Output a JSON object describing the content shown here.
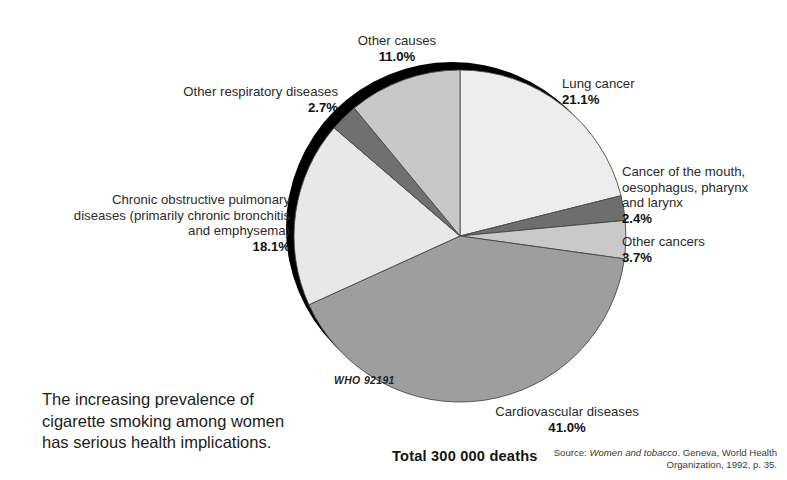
{
  "figure": {
    "caption": "The increasing prevalence of cigarette smoking among women has serious health implications.",
    "total_label": "Total 300 000 deaths",
    "who_code": "WHO  92191",
    "source_prefix": "Source: ",
    "source_italic": "Women and tobacco",
    "source_rest": ". Geneva, World Health Organization, 1992, p. 35."
  },
  "labels": {
    "lung_cancer": {
      "name": "Lung cancer",
      "pct": "21.1%"
    },
    "mouth_cancer": {
      "name": "Cancer of the mouth, oesophagus, pharynx and larynx",
      "line1": "Cancer of the mouth,",
      "line2": "oesophagus, pharynx",
      "line3": "and larynx",
      "pct": "2.4%"
    },
    "other_cancers": {
      "name": "Other cancers",
      "pct": "3.7%"
    },
    "cardiovascular": {
      "name": "Cardiovascular diseases",
      "pct": "41.0%"
    },
    "copd": {
      "name": "Chronic obstructive pulmonary diseases (primarily chronic bronchitis and emphysema)",
      "line1": "Chronic obstructive pulmonary",
      "line2": "diseases (primarily chronic bronchitis",
      "line3": "and emphysema)",
      "pct": "18.1%"
    },
    "other_respiratory": {
      "name": "Other respiratory diseases",
      "pct": "2.7%"
    },
    "other_causes": {
      "name": "Other causes",
      "pct": "11.0%"
    }
  },
  "chart_data": {
    "type": "pie",
    "title": "Total 300 000 deaths",
    "subtitle": "Deaths attributable to smoking among women",
    "total": 300000,
    "total_text": "Total 300 000 deaths",
    "units": "percent of deaths",
    "start_angle_deg": 0,
    "direction": "clockwise",
    "legend": "labels placed around pie with leader positions",
    "grid": false,
    "categories": [
      "Lung cancer",
      "Cancer of the mouth, oesophagus, pharynx and larynx",
      "Other cancers",
      "Cardiovascular diseases",
      "Chronic obstructive pulmonary diseases (primarily chronic bronchitis and emphysema)",
      "Other respiratory diseases",
      "Other causes"
    ],
    "values": [
      21.1,
      2.4,
      3.7,
      41.0,
      18.1,
      2.7,
      11.0
    ],
    "colors": [
      "#ededed",
      "#6e6e6e",
      "#c9c9c9",
      "#9e9e9e",
      "#e8e8e8",
      "#707070",
      "#c8c8c8"
    ],
    "slices": [
      {
        "label": "Lung cancer",
        "value": 21.1,
        "display": "21.1%",
        "color": "#ededed"
      },
      {
        "label": "Cancer of the mouth, oesophagus, pharynx and larynx",
        "value": 2.4,
        "display": "2.4%",
        "color": "#6e6e6e"
      },
      {
        "label": "Other cancers",
        "value": 3.7,
        "display": "3.7%",
        "color": "#c9c9c9"
      },
      {
        "label": "Cardiovascular diseases",
        "value": 41.0,
        "display": "41.0%",
        "color": "#9e9e9e"
      },
      {
        "label": "Chronic obstructive pulmonary diseases (primarily chronic bronchitis and emphysema)",
        "value": 18.1,
        "display": "18.1%",
        "color": "#e8e8e8"
      },
      {
        "label": "Other respiratory diseases",
        "value": 2.7,
        "display": "2.7%",
        "color": "#707070"
      },
      {
        "label": "Other causes",
        "value": 11.0,
        "display": "11.0%",
        "color": "#c8c8c8"
      }
    ],
    "shadow_color": "#000000",
    "background": "#ffffff"
  }
}
